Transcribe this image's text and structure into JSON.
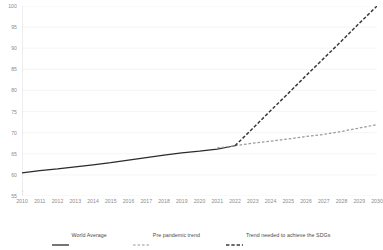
{
  "chart_data": {
    "type": "line",
    "title": "",
    "subtitle": "",
    "xlabel": "",
    "ylabel": "",
    "xlim": [
      2010,
      2030
    ],
    "ylim": [
      55,
      100
    ],
    "y_axis_break": true,
    "y_break_symbol": "axis-break-zigzag",
    "grid": true,
    "grid_axis": "y",
    "legend_position": "bottom",
    "x": [
      2010,
      2011,
      2012,
      2013,
      2014,
      2015,
      2016,
      2017,
      2018,
      2019,
      2020,
      2021,
      2022,
      2023,
      2024,
      2025,
      2026,
      2027,
      2028,
      2029,
      2030
    ],
    "x_tick_labels": [
      "2010",
      "2011",
      "2012",
      "2013",
      "2014",
      "2015",
      "2016",
      "2017",
      "2018",
      "2019",
      "2020",
      "2021",
      "2022",
      "2023",
      "2024",
      "2025",
      "2026",
      "2027",
      "2028",
      "2029",
      "2030"
    ],
    "y_tick_labels": [
      "55",
      "60",
      "65",
      "70",
      "75",
      "80",
      "85",
      "90",
      "95",
      "100"
    ],
    "y_ticks": [
      55,
      60,
      65,
      70,
      75,
      80,
      85,
      90,
      95,
      100
    ],
    "series": [
      {
        "name": "World Average",
        "style": "solid",
        "color": "#2b2b2b",
        "x": [
          2010,
          2011,
          2012,
          2013,
          2014,
          2015,
          2016,
          2017,
          2018,
          2019,
          2020,
          2021,
          2022
        ],
        "values": [
          60.5,
          61.0,
          61.4,
          61.9,
          62.4,
          62.9,
          63.5,
          64.1,
          64.7,
          65.2,
          65.6,
          66.1,
          66.9
        ]
      },
      {
        "name": "Pre pandemic trend",
        "style": "dashed",
        "color": "#9a9a9a",
        "x": [
          2021,
          2022,
          2023,
          2024,
          2025,
          2026,
          2027,
          2028,
          2029,
          2030
        ],
        "values": [
          66.4,
          66.9,
          67.5,
          68.0,
          68.5,
          69.1,
          69.6,
          70.3,
          71.1,
          71.9
        ]
      },
      {
        "name": "Trend needed to achieve the SDGs",
        "style": "dashed",
        "color": "#3a3a3a",
        "x": [
          2022,
          2023,
          2024,
          2025,
          2026,
          2027,
          2028,
          2029,
          2030
        ],
        "values": [
          66.9,
          71.0,
          75.2,
          79.3,
          83.5,
          87.6,
          91.7,
          95.9,
          100.0
        ]
      }
    ],
    "legend": [
      {
        "label": "World Average",
        "style": "solid",
        "color": "#2b2b2b"
      },
      {
        "label": "Pre pandemic trend",
        "style": "dashed-thin",
        "color": "#9a9a9a"
      },
      {
        "label": "Trend needed to achieve the SDGs",
        "style": "dashed-bold",
        "color": "#3a3a3a"
      }
    ]
  }
}
